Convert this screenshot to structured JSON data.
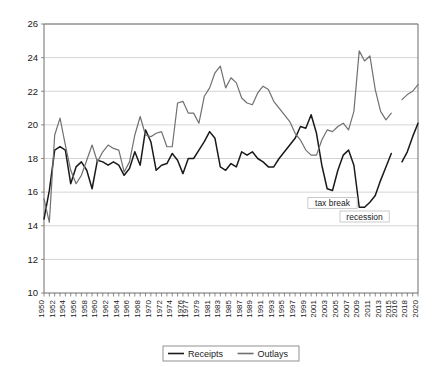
{
  "chart_data": {
    "type": "line",
    "title": "",
    "xlabel": "",
    "ylabel": "",
    "ylim": [
      10,
      26
    ],
    "ytick_step": 2,
    "ytick_labels": [
      "10",
      "12",
      "14",
      "16",
      "18",
      "20",
      "22",
      "24",
      "26"
    ],
    "grid": true,
    "legend_position": "bottom",
    "xlim": [
      1950,
      2020
    ],
    "x": [
      1950,
      1951,
      1952,
      1953,
      1954,
      1955,
      1956,
      1957,
      1958,
      1959,
      1960,
      1961,
      1962,
      1963,
      1964,
      1965,
      1966,
      1967,
      1968,
      1969,
      1970,
      1971,
      1972,
      1973,
      1974,
      1975,
      1976,
      1977,
      1978,
      1979,
      1980,
      1981,
      1982,
      1983,
      1984,
      1985,
      1986,
      1987,
      1988,
      1989,
      1990,
      1991,
      1992,
      1993,
      1994,
      1995,
      1996,
      1997,
      1998,
      1999,
      2000,
      2001,
      2002,
      2003,
      2004,
      2005,
      2006,
      2007,
      2008,
      2009,
      2010,
      2011,
      2012,
      2013,
      2014,
      2015,
      2016,
      2017,
      2018,
      2019,
      2020
    ],
    "xtick_labels": [
      "1950",
      "1952",
      "1954",
      "1956",
      "1958",
      "1960",
      "1962",
      "1964",
      "1966",
      "1968",
      "1970",
      "1972",
      "1974",
      "1976",
      "1977",
      "1979",
      "1981",
      "1983",
      "1985",
      "1987",
      "1989",
      "1991",
      "1993",
      "1995",
      "1997",
      "1999",
      "2001",
      "2003",
      "2005",
      "2007",
      "2009",
      "2011",
      "2013",
      "2015",
      "2016",
      "2018",
      "2020"
    ],
    "series": [
      {
        "name": "Receipts",
        "color": "#1a1a1a",
        "width": 1.5,
        "values": [
          14.4,
          16.1,
          18.5,
          18.7,
          18.5,
          16.5,
          17.5,
          17.8,
          17.3,
          16.2,
          17.9,
          17.8,
          17.6,
          17.8,
          17.6,
          17.0,
          17.4,
          18.4,
          17.6,
          19.7,
          19.0,
          17.3,
          17.6,
          17.7,
          18.3,
          17.9,
          17.1,
          18.0,
          18.0,
          18.5,
          19.0,
          19.6,
          19.2,
          17.5,
          17.3,
          17.7,
          17.5,
          18.4,
          18.2,
          18.4,
          18.0,
          17.8,
          17.5,
          17.5,
          18.0,
          18.4,
          18.8,
          19.2,
          19.9,
          19.8,
          20.6,
          19.5,
          17.6,
          16.2,
          16.1,
          17.3,
          18.2,
          18.5,
          17.6,
          15.1,
          15.1,
          15.4,
          15.8,
          16.7,
          17.5,
          18.3,
          null,
          17.8,
          18.4,
          19.3,
          20.1
        ]
      },
      {
        "name": "Outlays",
        "color": "#707070",
        "width": 1.2,
        "values": [
          15.6,
          14.2,
          19.4,
          20.4,
          18.8,
          17.3,
          16.5,
          17.0,
          17.9,
          18.8,
          17.8,
          18.4,
          18.8,
          18.6,
          18.5,
          17.2,
          17.8,
          19.4,
          20.5,
          19.4,
          19.3,
          19.5,
          19.6,
          18.7,
          18.7,
          21.3,
          21.4,
          20.7,
          20.7,
          20.1,
          21.7,
          22.2,
          23.1,
          23.5,
          22.2,
          22.8,
          22.5,
          21.6,
          21.3,
          21.2,
          21.9,
          22.3,
          22.1,
          21.4,
          21.0,
          20.6,
          20.2,
          19.5,
          19.1,
          18.5,
          18.2,
          18.2,
          19.1,
          19.7,
          19.6,
          19.9,
          20.1,
          19.7,
          20.8,
          24.4,
          23.8,
          24.1,
          22.1,
          20.8,
          20.3,
          20.7,
          null,
          21.5,
          21.8,
          22.0,
          22.4
        ]
      }
    ],
    "annotations": [
      {
        "label": "tax break",
        "x": 2004,
        "y": 15.35
      },
      {
        "label": "recession",
        "x": 2010,
        "y": 14.55
      }
    ]
  },
  "legend": {
    "items": [
      {
        "label": "Receipts"
      },
      {
        "label": "Outlays"
      }
    ]
  }
}
